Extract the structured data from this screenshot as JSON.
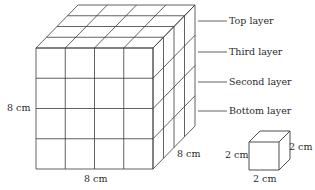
{
  "figure": {
    "layer_labels": [
      {
        "text": "Top layer",
        "y": 21
      },
      {
        "text": "Third layer",
        "y": 52
      },
      {
        "text": "Second layer",
        "y": 82
      },
      {
        "text": "Bottom layer",
        "y": 111
      }
    ],
    "large_cube": {
      "height_label": "8 cm",
      "width_label": "8 cm",
      "depth_label": "8 cm",
      "divisions": 4
    },
    "small_cube": {
      "height_label": "2 cm",
      "width_label": "2 cm",
      "depth_label": "2 cm"
    },
    "line_color": "#3a3a3a"
  }
}
